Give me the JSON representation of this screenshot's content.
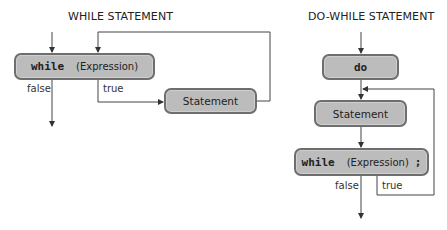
{
  "left_diagram": {
    "title": "WHILE STATEMENT",
    "while_box": {
      "keyword": "while",
      "expression": "(Expression)"
    },
    "statement_box": {
      "label": "Statement"
    },
    "false_label": "false",
    "true_label": "true"
  },
  "right_diagram": {
    "title": "DO-WHILE STATEMENT",
    "do_box": {
      "keyword": "do"
    },
    "statement_box": {
      "label": "Statement"
    },
    "while_box": {
      "keyword": "while",
      "expression": "(Expression)",
      "terminator": ";"
    },
    "false_label": "false",
    "true_label": "true"
  },
  "colors": {
    "box_fill": "#bcbcbc",
    "box_border": "#6e6e6e",
    "line": "#333333"
  }
}
